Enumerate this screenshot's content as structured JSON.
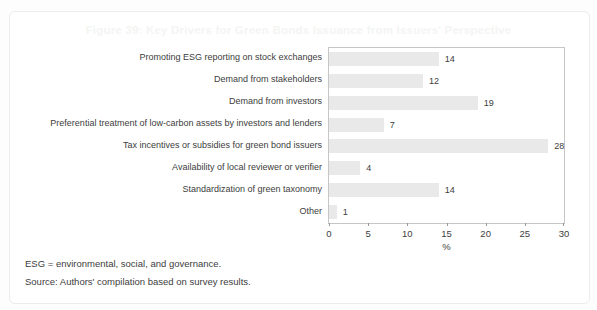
{
  "title": "Figure 39: Key Drivers for Green Bonds Issuance from Issuers' Perspective",
  "chart_data": {
    "type": "bar",
    "orientation": "horizontal",
    "title": "Figure 39: Key Drivers for Green Bonds Issuance from Issuers' Perspective",
    "categories": [
      "Promoting ESG reporting on stock exchanges",
      "Demand from stakeholders",
      "Demand from investors",
      "Preferential treatment of low-carbon assets by investors and lenders",
      "Tax incentives or subsidies for green bond issuers",
      "Availability of local reviewer or verifier",
      "Standardization of green taxonomy",
      "Other"
    ],
    "values": [
      14,
      12,
      19,
      7,
      28,
      4,
      14,
      1
    ],
    "xlabel": "%",
    "ylabel": "",
    "xlim": [
      0,
      30
    ],
    "xticks": [
      0,
      5,
      10,
      15,
      20,
      25,
      30
    ],
    "grid": false,
    "legend": false,
    "value_labels": true,
    "bar_color": "#e9e9e9"
  },
  "footnotes": {
    "definition": "ESG = environmental, social, and governance.",
    "source": "Source: Authors' compilation based on survey results."
  },
  "colors": {
    "bar": "#e9e9e9",
    "plot_border": "#c6c6c6",
    "text": "#3d3d3d",
    "title": "#f3f5f3",
    "panel_border": "#ececec",
    "background": "#ffffff"
  }
}
